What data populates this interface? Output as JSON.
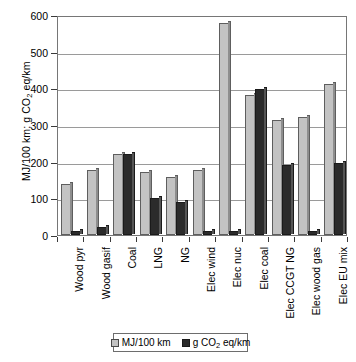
{
  "chart_data": {
    "type": "bar",
    "title": "",
    "xlabel": "",
    "ylabel": "MJ/100 km; g CO2 eq/km",
    "ylim": [
      0,
      600
    ],
    "ytick_step": 100,
    "yticks": [
      0,
      100,
      200,
      300,
      400,
      500,
      600
    ],
    "grid": true,
    "legend_position": "bottom",
    "categories": [
      "Wood pyr",
      "Wood gasif",
      "Coal",
      "LNG",
      "NG",
      "Elec wind",
      "Elec nuc",
      "Elec coal",
      "Elec CCGT NG",
      "Elec wood gas",
      "Elec EU mix"
    ],
    "series": [
      {
        "name": "MJ/100 km",
        "color": "#c3c3c3",
        "values": [
          138,
          178,
          220,
          172,
          158,
          176,
          578,
          383,
          313,
          322,
          413
        ]
      },
      {
        "name": "g CO2 eq/km",
        "color": "#2b2b2b",
        "values": [
          12,
          22,
          220,
          100,
          90,
          10,
          11,
          397,
          190,
          10,
          197
        ]
      }
    ]
  },
  "axis": {
    "y_title_prefix": "MJ/100 km; g CO",
    "y_title_sub": "2",
    "y_title_suffix": " eq/km",
    "tick_labels": [
      "600",
      "500",
      "400",
      "300",
      "200",
      "100",
      "0"
    ]
  },
  "legend": {
    "items": [
      {
        "label": "MJ/100 km",
        "swatch": "light-gray-swatch"
      },
      {
        "label_prefix": "g CO",
        "label_sub": "2",
        "label_suffix": " eq/km",
        "swatch": "dark-swatch"
      }
    ]
  }
}
